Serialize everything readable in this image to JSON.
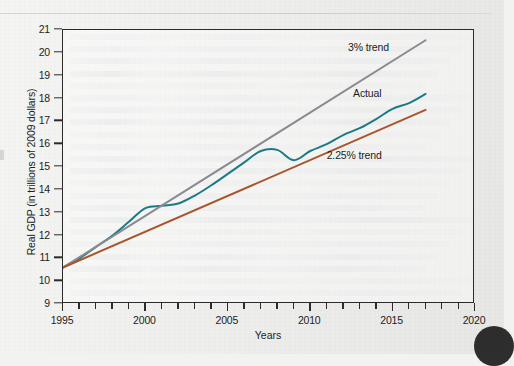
{
  "figure": {
    "x_axis_title": "Years",
    "y_axis_title": "Real GDP (in trillions of 2009 dollars)"
  },
  "annotations": {
    "trend3": "3% trend",
    "actual": "Actual",
    "trend225": "2.25% trend"
  },
  "colors": {
    "actual": "#1b7a85",
    "trend3": "#8a8a92",
    "trend225": "#a9552c",
    "axis": "#2b2b2b",
    "text": "#1d1d1d",
    "page": "#f1f1ef"
  },
  "chart_data": {
    "type": "line",
    "title": "",
    "xlabel": "Years",
    "ylabel": "Real GDP (in trillions of 2009 dollars)",
    "xlim": [
      1995,
      2020
    ],
    "ylim": [
      9,
      21
    ],
    "xticks": [
      1995,
      1996,
      1997,
      1998,
      1999,
      2000,
      2001,
      2002,
      2003,
      2004,
      2005,
      2006,
      2007,
      2008,
      2009,
      2010,
      2011,
      2012,
      2013,
      2014,
      2015,
      2016,
      2017,
      2018,
      2019,
      2020
    ],
    "xtick_labels": [
      "1995",
      "2000",
      "2005",
      "2010",
      "2015",
      "2020"
    ],
    "xtick_labeled_values": [
      1995,
      2000,
      2005,
      2010,
      2015,
      2020
    ],
    "yticks": [
      9,
      10,
      11,
      12,
      13,
      14,
      15,
      16,
      17,
      18,
      19,
      20,
      21
    ],
    "grid": false,
    "legend": "inline-annotations",
    "series": [
      {
        "name": "Actual",
        "color": "#1b7a85",
        "x": [
          1995,
          1996,
          1997,
          1998,
          1999,
          2000,
          2001,
          2002,
          2003,
          2004,
          2005,
          2006,
          2007,
          2008,
          2009,
          2010,
          2011,
          2012,
          2013,
          2014,
          2015,
          2016,
          2017
        ],
        "values": [
          10.6,
          11.0,
          11.5,
          12.0,
          12.6,
          13.2,
          13.3,
          13.4,
          13.75,
          14.2,
          14.7,
          15.2,
          15.7,
          15.75,
          15.3,
          15.7,
          16.0,
          16.4,
          16.7,
          17.1,
          17.55,
          17.8,
          18.2
        ]
      },
      {
        "name": "3% trend",
        "color": "#8a8a92",
        "x": [
          1995,
          2017
        ],
        "values": [
          10.6,
          20.55
        ]
      },
      {
        "name": "2.25% trend",
        "color": "#a9552c",
        "x": [
          1995,
          2017
        ],
        "values": [
          10.6,
          17.5
        ]
      }
    ]
  }
}
